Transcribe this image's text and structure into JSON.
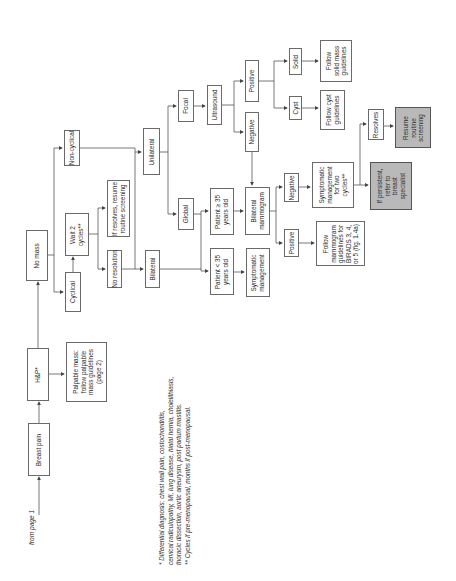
{
  "entry": {
    "label": "from page 1"
  },
  "nodes": {
    "breast_pain": "Breast pain",
    "h_and_p": "H&P*",
    "palpable_mass": "Palpable mass:\nfollow palpable\nmass guidelines\n(page 2)",
    "no_mass": "No mass",
    "cyclical": "Cyclical",
    "wait_2_cycles": "Wait 2\ncycles**",
    "no_resolution": "No resolution",
    "if_resolves_resume": "If resolves, resume\nroutine screening",
    "non_cyclical": "Non-cyclical",
    "unilateral": "Unilateral",
    "bilateral": "Bilateral",
    "focal": "Focal",
    "global": "Global",
    "ultrasound": "Ultrasound",
    "us_positive": "Positive",
    "us_negative": "Negative",
    "solid": "Solid",
    "cyst": "Cyst",
    "follow_solid": "Follow\nsolid mass\nguidelines",
    "follow_cyst": "Follow cyst\nguidelines",
    "patient_ge_35": "Patient ≥ 35\nyears old",
    "patient_lt_35": "Patient < 35\nyears old",
    "bilateral_mammogram": "Bilateral\nmammogram",
    "symptomatic_management": "Symptomatic\nmanagement",
    "mammo_negative": "Negative",
    "mammo_positive": "Positive",
    "symptomatic_two_cycles": "Symptomatic\nmanagement\nfor two\ncycles**",
    "follow_mammogram": "Follow\nmammogram\nguidelines for\nBIRADS 3, 4,\nor 5 (fig. 1.4a)",
    "resolves": "Resolves",
    "resume_routine": "Resume\nroutine\nscreening",
    "if_persistent_refer": "If persistent,\nrefer to\nbreast\nspecialist"
  },
  "footnotes": {
    "text": "* Differential diagnosis: chest wall pain, costochondritis,\ncervical radiculopathy, MI, lung disease, hiatal hernia, cholelithiasis,\nthoracic dissection, aortic aneurysm, post partum mastitis.\n** Cycles if pre-menopausal, months if post-menopausal."
  },
  "colors": {
    "line": "#555555",
    "box_border": "#6a6a6a",
    "highlight_fill": "#b9b9b9"
  }
}
